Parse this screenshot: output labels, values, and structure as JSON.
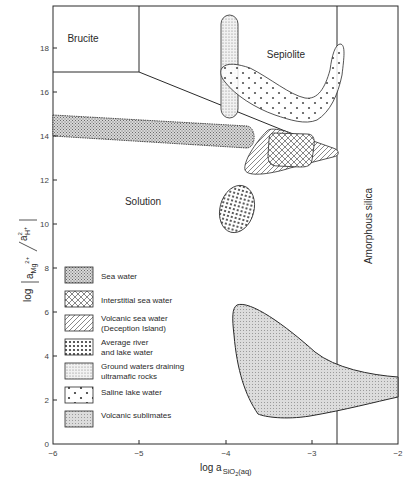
{
  "diagram": {
    "type": "stability-diagram",
    "x_axis": {
      "label_main": "log a",
      "label_sub": "SiO",
      "label_sub2": "2",
      "label_tail": "(aq)",
      "ticks": [
        "−6",
        "−5",
        "−4",
        "−3",
        "−2"
      ],
      "range": [
        -6,
        -2
      ]
    },
    "y_axis": {
      "label_prefix": "log",
      "label_num": "a",
      "label_num_sub": "Mg",
      "label_num_sup": "2+",
      "label_den": "a",
      "label_den_sup": "2",
      "label_den_sub": "H",
      "label_den_sub_sup": "+",
      "ticks": [
        "0",
        "2",
        "4",
        "6",
        "8",
        "10",
        "12",
        "14",
        "16",
        "18"
      ],
      "range": [
        0,
        19.5
      ]
    },
    "fields": {
      "brucite": "Brucite",
      "sepiolite": "Sepiolite",
      "solution": "Solution",
      "amorphous_silica": "Amorphous silica"
    },
    "legend": [
      {
        "id": "sea-water",
        "lines": [
          "Sea water"
        ],
        "pattern": "fine-stipple"
      },
      {
        "id": "interstitial-sea-water",
        "lines": [
          "Interstitial sea water"
        ],
        "pattern": "crosshatch"
      },
      {
        "id": "volcanic-sea-water",
        "lines": [
          "Volcanic sea water",
          "(Deception Island)"
        ],
        "pattern": "diagonal-hatch"
      },
      {
        "id": "average-river-lake-water",
        "lines": [
          "Average river",
          "and lake water"
        ],
        "pattern": "dense-dots"
      },
      {
        "id": "ground-waters-ultramafic",
        "lines": [
          "Ground waters draining",
          "ultramafic rocks"
        ],
        "pattern": "sparse-stipple"
      },
      {
        "id": "saline-lake-water",
        "lines": [
          "Saline lake water"
        ],
        "pattern": "large-dots"
      },
      {
        "id": "volcanic-sublimates",
        "lines": [
          "Volcanic sublimates"
        ],
        "pattern": "light-stipple"
      }
    ],
    "colors": {
      "line": "#2a2a2a",
      "fill_gray": "#bdbdbd",
      "background": "#ffffff"
    }
  }
}
